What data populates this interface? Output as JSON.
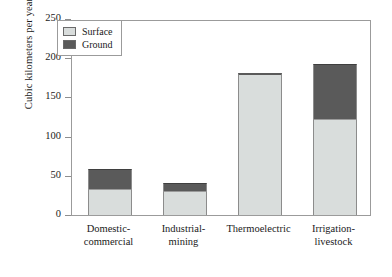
{
  "chart_data": {
    "type": "bar",
    "subtype": "stacked-bar",
    "title": "",
    "xlabel": "",
    "ylabel": "Cubic kilometers per year",
    "ylim": [
      0,
      250
    ],
    "yticks": [
      0,
      50,
      100,
      150,
      200,
      250
    ],
    "ytick_labels": [
      "0",
      "50",
      "100",
      "150",
      "200",
      "250"
    ],
    "grid": false,
    "legend_position": "upper left",
    "categories": [
      "Domestic-commercial",
      "Industrial-mining",
      "Thermoelectric",
      "Irrigation-livestock"
    ],
    "category_lines": [
      [
        "Domestic-",
        "commercial"
      ],
      [
        "Industrial-",
        "mining"
      ],
      [
        "Thermoelectric",
        ""
      ],
      [
        "Irrigation-",
        "livestock"
      ]
    ],
    "series": [
      {
        "name": "Surface",
        "color": "#d9dddc",
        "values": [
          33,
          30,
          181,
          122
        ]
      },
      {
        "name": "Ground",
        "color": "#5a5a5a",
        "values": [
          26,
          11,
          0,
          71
        ]
      }
    ],
    "totals": [
      59,
      41,
      181,
      193
    ]
  },
  "legend": {
    "entries": [
      {
        "label": "Surface",
        "color": "#d9dddc"
      },
      {
        "label": "Ground",
        "color": "#5a5a5a"
      }
    ]
  },
  "axis": {
    "y_title": "Cubic kilometers per year",
    "frame_color": "#9b9b9b"
  }
}
